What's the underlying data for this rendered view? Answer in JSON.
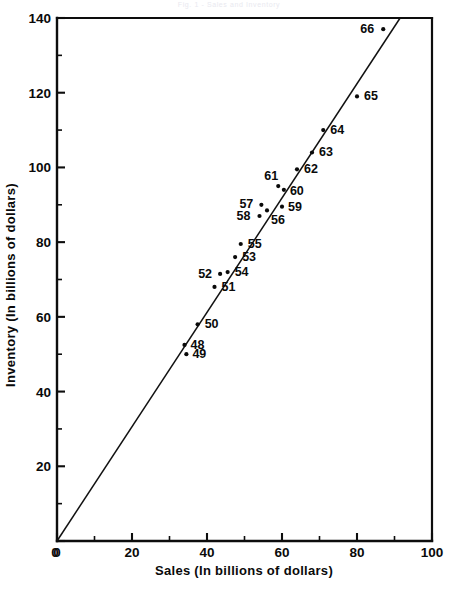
{
  "chart_data": {
    "type": "scatter",
    "title": "Fig. 1 - Sales and Inventory",
    "xlabel": "Sales (In billions of dollars)",
    "ylabel": "Inventory (In billions of dollars)",
    "xlim": [
      0,
      100
    ],
    "ylim": [
      0,
      140
    ],
    "xticks": [
      0,
      20,
      40,
      60,
      80,
      100
    ],
    "yticks": [
      0,
      20,
      40,
      60,
      80,
      100,
      120,
      140
    ],
    "xtick_labels": [
      "0",
      "20",
      "40",
      "60",
      "80",
      "100"
    ],
    "ytick_labels": [
      "0",
      "20",
      "40",
      "60",
      "80",
      "100",
      "120",
      "140"
    ],
    "x_minor_step": 10,
    "y_minor_step": 10,
    "grid": false,
    "legend": null,
    "series": [
      {
        "name": "Year observations",
        "point_labels": [
          "48",
          "49",
          "50",
          "51",
          "52",
          "53",
          "54",
          "55",
          "56",
          "57",
          "58",
          "59",
          "60",
          "61",
          "62",
          "63",
          "64",
          "65",
          "66"
        ],
        "x": [
          34.0,
          34.5,
          37.5,
          42.0,
          43.5,
          47.5,
          45.5,
          49.0,
          56.0,
          54.5,
          54.0,
          60.0,
          60.5,
          59.0,
          64.0,
          68.0,
          71.0,
          80.0,
          87.0
        ],
        "y": [
          52.5,
          50.0,
          58.0,
          68.0,
          71.5,
          76.0,
          72.0,
          79.5,
          88.5,
          90.0,
          87.0,
          89.5,
          94.0,
          95.0,
          99.5,
          104.0,
          110.0,
          119.0,
          137.0
        ],
        "label_offsets": [
          {
            "dx": 6,
            "dy": 4
          },
          {
            "dx": 6,
            "dy": 4
          },
          {
            "dx": 7,
            "dy": 4
          },
          {
            "dx": 7,
            "dy": 4
          },
          {
            "dx": -22,
            "dy": 4
          },
          {
            "dx": 7,
            "dy": 4
          },
          {
            "dx": 7,
            "dy": 4
          },
          {
            "dx": 7,
            "dy": 4
          },
          {
            "dx": 4,
            "dy": 14
          },
          {
            "dx": -22,
            "dy": 3
          },
          {
            "dx": -23,
            "dy": 4
          },
          {
            "dx": 6,
            "dy": 4
          },
          {
            "dx": 6,
            "dy": 5
          },
          {
            "dx": -14,
            "dy": -6
          },
          {
            "dx": 7,
            "dy": 4
          },
          {
            "dx": 7,
            "dy": 4
          },
          {
            "dx": 7,
            "dy": 4
          },
          {
            "dx": 7,
            "dy": 4
          },
          {
            "dx": -23,
            "dy": 4
          }
        ]
      }
    ],
    "trendline": {
      "type": "line",
      "x": [
        0,
        91.5
      ],
      "y": [
        0,
        140
      ]
    }
  },
  "chart": {
    "title": "Fig. 1 - Sales and Inventory",
    "xlabel": "Sales (In billions of dollars)",
    "ylabel": "Inventory (In billions of dollars)"
  }
}
